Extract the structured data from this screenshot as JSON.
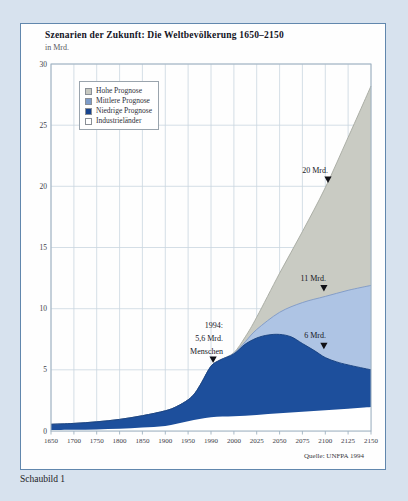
{
  "page": {
    "caption": "Schaubild 1",
    "background": "#d7e2ee"
  },
  "card": {
    "title": "Szenarien der Zukunft: Die Weltbevölkerung 1650–2150",
    "subtitle": "in Mrd.",
    "source": "Quelle: UNFPA 1994",
    "border_color": "#6187ad"
  },
  "legend": {
    "items": [
      {
        "label": "Hohe Prognose",
        "swatch": "#c6c8c0"
      },
      {
        "label": "Mittlere Prognose",
        "swatch": "#7d9cc9"
      },
      {
        "label": "Niedrige Prognose",
        "swatch": "#17448f"
      },
      {
        "label": "Industrieländer",
        "swatch": "#ffffff"
      }
    ]
  },
  "chart_data": {
    "type": "area",
    "title": "Szenarien der Zukunft: Die Weltbevölkerung 1650–2150",
    "ylabel": "in Mrd.",
    "ylim": [
      0,
      30
    ],
    "grid": true,
    "x_ticks": [
      "1650",
      "1700",
      "1750",
      "1800",
      "1850",
      "1900",
      "1950",
      "1990",
      "2000",
      "2025",
      "2050",
      "2075",
      "2100",
      "2125",
      "2150"
    ],
    "y_ticks": [
      0,
      5,
      10,
      15,
      20,
      25,
      30
    ],
    "series": [
      {
        "name": "Hohe Prognose",
        "color": "#c9cbc3",
        "edge": "#a6a9a0",
        "points": [
          [
            0,
            0.55
          ],
          [
            1,
            0.62
          ],
          [
            2,
            0.75
          ],
          [
            3,
            0.95
          ],
          [
            4,
            1.25
          ],
          [
            5,
            1.65
          ],
          [
            5.5,
            2.0
          ],
          [
            6,
            2.55
          ],
          [
            6.3,
            3.1
          ],
          [
            6.6,
            4.0
          ],
          [
            7,
            5.3
          ],
          [
            7.4,
            5.8
          ],
          [
            8,
            6.4
          ],
          [
            8.5,
            7.7
          ],
          [
            9,
            9.3
          ],
          [
            10,
            12.9
          ],
          [
            11,
            16.3
          ],
          [
            12,
            19.9
          ],
          [
            13,
            24.0
          ],
          [
            14,
            28.2
          ]
        ]
      },
      {
        "name": "Mittlere Prognose",
        "color": "#aec4e4",
        "edge": "#7e99c6",
        "points": [
          [
            0,
            0.55
          ],
          [
            1,
            0.62
          ],
          [
            2,
            0.75
          ],
          [
            3,
            0.95
          ],
          [
            4,
            1.25
          ],
          [
            5,
            1.65
          ],
          [
            5.5,
            2.0
          ],
          [
            6,
            2.55
          ],
          [
            6.3,
            3.1
          ],
          [
            6.6,
            4.0
          ],
          [
            7,
            5.3
          ],
          [
            7.4,
            5.8
          ],
          [
            8,
            6.35
          ],
          [
            8.5,
            7.3
          ],
          [
            9,
            8.3
          ],
          [
            10,
            9.7
          ],
          [
            11,
            10.5
          ],
          [
            12,
            11.0
          ],
          [
            13,
            11.5
          ],
          [
            14,
            11.9
          ]
        ]
      },
      {
        "name": "Niedrige Prognose",
        "color": "#1d4f9c",
        "edge": "#163f7e",
        "points": [
          [
            0,
            0.55
          ],
          [
            1,
            0.62
          ],
          [
            2,
            0.75
          ],
          [
            3,
            0.95
          ],
          [
            4,
            1.25
          ],
          [
            5,
            1.65
          ],
          [
            5.5,
            2.0
          ],
          [
            6,
            2.55
          ],
          [
            6.3,
            3.1
          ],
          [
            6.6,
            4.0
          ],
          [
            7,
            5.3
          ],
          [
            7.4,
            5.8
          ],
          [
            8,
            6.3
          ],
          [
            8.5,
            7.1
          ],
          [
            9,
            7.6
          ],
          [
            9.5,
            7.85
          ],
          [
            10,
            7.9
          ],
          [
            10.5,
            7.7
          ],
          [
            11,
            7.15
          ],
          [
            11.5,
            6.6
          ],
          [
            12,
            6.0
          ],
          [
            12.5,
            5.65
          ],
          [
            13,
            5.4
          ],
          [
            14,
            5.0
          ]
        ]
      },
      {
        "name": "Industrieländer",
        "color": "#ffffff",
        "edge": "#ffffff",
        "points": [
          [
            0,
            0.08
          ],
          [
            1,
            0.1
          ],
          [
            2,
            0.13
          ],
          [
            3,
            0.18
          ],
          [
            4,
            0.28
          ],
          [
            5,
            0.42
          ],
          [
            6,
            0.8
          ],
          [
            7,
            1.12
          ],
          [
            8,
            1.2
          ],
          [
            9,
            1.32
          ],
          [
            10,
            1.45
          ],
          [
            11,
            1.57
          ],
          [
            12,
            1.7
          ],
          [
            13,
            1.82
          ],
          [
            14,
            1.95
          ]
        ]
      }
    ],
    "annotations": [
      {
        "lines": [
          "1994:",
          "5,6 Mrd.",
          "Menschen"
        ],
        "text_x": 202,
        "text_y": 304,
        "line_h": 13,
        "marker": {
          "xi": 7.09,
          "v": 5.55
        }
      },
      {
        "lines": [
          "20 Mrd."
        ],
        "text_x": 307,
        "text_y": 149,
        "line_h": 13,
        "marker": {
          "xi": 12.12,
          "v": 20.28
        }
      },
      {
        "lines": [
          "11 Mrd."
        ],
        "text_x": 305,
        "text_y": 257,
        "line_h": 13,
        "marker": {
          "xi": 11.94,
          "v": 11.4
        }
      },
      {
        "lines": [
          "6 Mrd."
        ],
        "text_x": 305,
        "text_y": 314,
        "line_h": 13,
        "marker": {
          "xi": 11.94,
          "v": 6.68
        }
      }
    ],
    "colors": {
      "grid": "#c9d5e0",
      "frame": "#9fb2c1",
      "marker": "#101016"
    }
  }
}
